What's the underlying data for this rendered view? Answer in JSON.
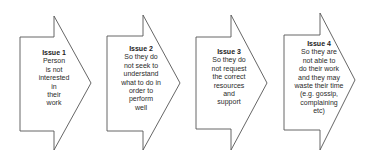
{
  "diagram": {
    "type": "chevron-flow",
    "stroke_color": "#555555",
    "fill_color": "#ffffff",
    "text_color": "#2a2a2a",
    "issues": [
      {
        "title": "Issue 1",
        "lines": [
          "Person",
          "is not",
          "interested",
          "in",
          "their",
          "work"
        ]
      },
      {
        "title": "Issue 2",
        "lines": [
          "So they do",
          "not seek to",
          "understand",
          "what to do in",
          "order to",
          "perform",
          "well"
        ]
      },
      {
        "title": "Issue 3",
        "lines": [
          "So they do",
          "not request",
          "the correct",
          "resources",
          "and",
          "support"
        ]
      },
      {
        "title": "Issue 4",
        "lines": [
          "So they are",
          "not able to",
          "do their work",
          "and they may",
          "waste their time",
          "(e.g. gossip,",
          "complaining",
          "etc)"
        ]
      }
    ]
  }
}
